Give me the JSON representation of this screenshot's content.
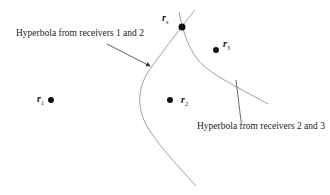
{
  "diagram": {
    "annotations": {
      "hyperbola_12": "Hyperbola from receivers 1 and 2",
      "hyperbola_23": "Hyperbola from receivers 2 and 3"
    },
    "points": {
      "rs": {
        "base": "r",
        "sub": "s"
      },
      "r1": {
        "base": "r",
        "sub": "1"
      },
      "r2": {
        "base": "r",
        "sub": "2"
      },
      "r3": {
        "base": "r",
        "sub": "3"
      }
    },
    "colors": {
      "curve": "#a0a0a0",
      "point": "#111111",
      "text": "#222222"
    }
  }
}
